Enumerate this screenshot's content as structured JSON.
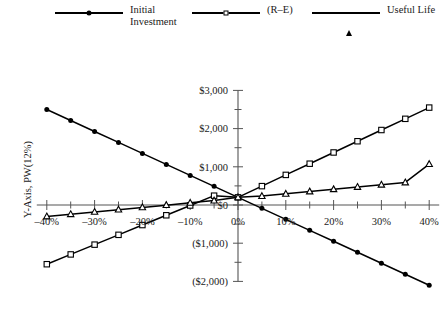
{
  "chart_data": {
    "type": "line",
    "title": "",
    "xlabel": "",
    "ylabel": "Y-Axis, PW(12%)",
    "xlim": [
      -40,
      40
    ],
    "ylim": [
      -2000,
      3000
    ],
    "x_tick_labels": [
      "–40%",
      "–30%",
      "–20%",
      "–10%",
      "0%",
      "10%",
      "20%",
      "30%",
      "40%"
    ],
    "x_tick_values": [
      -40,
      -30,
      -20,
      -10,
      0,
      10,
      20,
      30,
      40
    ],
    "y_tick_labels": [
      "$3,000",
      "$2,000",
      "$1,000",
      "$0",
      "($1,000)",
      "($2,000)"
    ],
    "y_tick_values": [
      3000,
      2000,
      1000,
      0,
      -1000,
      -2000
    ],
    "x_minor_step": 5,
    "y_minor_step": 500,
    "grid": false,
    "legend_position": "top",
    "x": [
      -40,
      -35,
      -30,
      -25,
      -20,
      -15,
      -10,
      -5,
      0,
      5,
      10,
      15,
      20,
      25,
      30,
      35,
      40
    ],
    "series": [
      {
        "name": "Initial\nInvestment",
        "marker": "filled-circle",
        "values": [
          2500,
          2213,
          1925,
          1638,
          1350,
          1063,
          775,
          488,
          200,
          -88,
          -375,
          -663,
          -950,
          -1238,
          -1525,
          -1813,
          -2100
        ]
      },
      {
        "name": "(R–E)",
        "marker": "open-square",
        "values": [
          -1550,
          -1294,
          -1038,
          -781,
          -525,
          -269,
          -13,
          244,
          200,
          494,
          788,
          1081,
          1375,
          1669,
          1963,
          2256,
          2550
        ]
      },
      {
        "name": "Useful Life",
        "marker": "open-triangle",
        "values": [
          -300,
          -241,
          -181,
          -122,
          -63,
          -4,
          56,
          115,
          200,
          234,
          293,
          353,
          412,
          471,
          531,
          590,
          1070
        ]
      }
    ]
  },
  "legend": {
    "entries": [
      {
        "label": "Initial\nInvestment",
        "marker": "filled-circle"
      },
      {
        "label": "(R–E)",
        "marker": "open-square"
      },
      {
        "label": "Useful Life",
        "marker": "open-triangle"
      }
    ]
  },
  "axis": {
    "y_title": "Y-Axis, PW(12%)"
  },
  "colors": {
    "line": "#000000",
    "axis": "#555555",
    "background": "#ffffff",
    "text": "#1a1a1a"
  }
}
